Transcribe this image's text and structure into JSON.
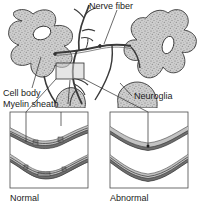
{
  "figure": {
    "title_labels": {
      "nerve_fiber": "Nerve fiber",
      "cell_body": "Cell body",
      "myelin_sheath": "Myelin sheath",
      "neuroglia": "Neuroglia"
    },
    "panels": [
      {
        "caption": "Normal"
      },
      {
        "caption": "Abnormal"
      }
    ],
    "colors": {
      "cell_fill": "#c9c9c9",
      "outline": "#3a3a3a",
      "sheath_dark": "#6e6e6e",
      "sheath_light": "#c2c2c2",
      "background": "#ffffff",
      "text": "#1b1b1b"
    },
    "icons": {
      "magnifier_box": "zoom-region-box",
      "leader_line": "leader-line"
    }
  }
}
